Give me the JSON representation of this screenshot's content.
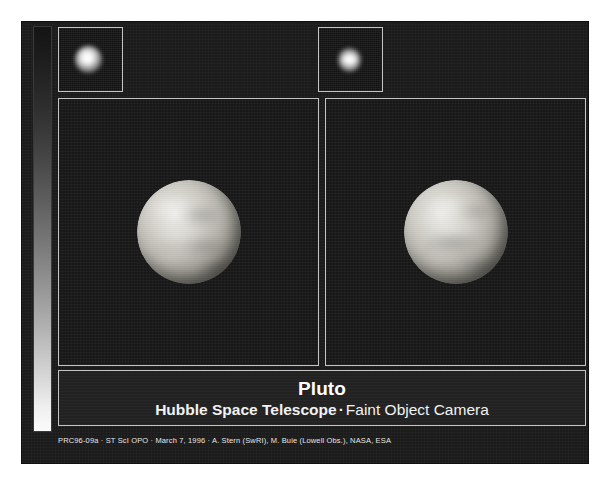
{
  "poster": {
    "title": "Pluto",
    "subtitle_bold": "Hubble Space Telescope",
    "subtitle_separator": "·",
    "subtitle_rest": "Faint Object Camera",
    "credit": "PRC96-09a · ST ScI OPO · March 7, 1996 · A. Stern (SwRI), M. Buie (Lowell Obs.), NASA, ESA",
    "colors": {
      "background": "#1b1b1b",
      "panel_background": "#181818",
      "title_panel_background": "#222222",
      "frame_border": "#c4c4c4",
      "title_text": "#ffffff",
      "credit_text": "#e6e6e6",
      "page_margin": "#ffffff"
    }
  },
  "grayscale_wedge": {
    "name": "grayscale-intensity-wedge",
    "from": "#141414",
    "to": "#fbfbfb"
  },
  "thumbnails": [
    {
      "name": "raw-image-hemisphere-1"
    },
    {
      "name": "raw-image-hemisphere-2"
    }
  ],
  "panels": [
    {
      "name": "pluto-surface-map-hemisphere-1"
    },
    {
      "name": "pluto-surface-map-hemisphere-2"
    }
  ]
}
